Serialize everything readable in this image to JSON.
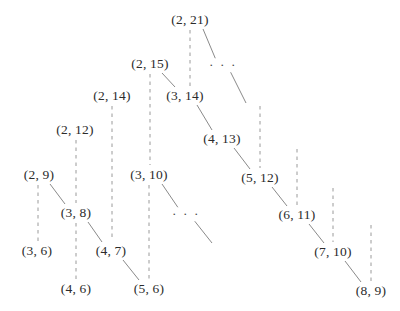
{
  "diagram": {
    "type": "tree",
    "title": "",
    "canvas": {
      "width": 400,
      "height": 311,
      "background": "#ffffff"
    },
    "styles": {
      "solid_edge_color": "#8a8a8a",
      "dashed_edge_color": "#9a9a9a",
      "label_color": "#2b2b2b"
    },
    "nodes": [
      {
        "id": "n2_21",
        "label": "(2, 21)",
        "x": 190,
        "y": 20
      },
      {
        "id": "n2_15",
        "label": "(2, 15)",
        "x": 150,
        "y": 64
      },
      {
        "id": "n3_14",
        "label": "(3, 14)",
        "x": 185,
        "y": 96
      },
      {
        "id": "n2_14",
        "label": "(2, 14)",
        "x": 112,
        "y": 96
      },
      {
        "id": "n4_13",
        "label": "(4, 13)",
        "x": 222,
        "y": 139
      },
      {
        "id": "n2_12",
        "label": "(2, 12)",
        "x": 75,
        "y": 130
      },
      {
        "id": "n3_10",
        "label": "(3, 10)",
        "x": 149,
        "y": 175
      },
      {
        "id": "n5_12",
        "label": "(5, 12)",
        "x": 260,
        "y": 178
      },
      {
        "id": "n2_9",
        "label": "(2, 9)",
        "x": 39,
        "y": 175
      },
      {
        "id": "n3_8",
        "label": "(3, 8)",
        "x": 76,
        "y": 213
      },
      {
        "id": "n6_11",
        "label": "(6, 11)",
        "x": 297,
        "y": 215
      },
      {
        "id": "n3_6",
        "label": "(3, 6)",
        "x": 37,
        "y": 251
      },
      {
        "id": "n4_7",
        "label": "(4, 7)",
        "x": 111,
        "y": 251
      },
      {
        "id": "n7_10",
        "label": "(7, 10)",
        "x": 333,
        "y": 252
      },
      {
        "id": "n4_6",
        "label": "(4, 6)",
        "x": 76,
        "y": 289
      },
      {
        "id": "n5_6",
        "label": "(5, 6)",
        "x": 149,
        "y": 289
      },
      {
        "id": "n8_9",
        "label": "(8, 9)",
        "x": 371,
        "y": 291
      }
    ],
    "ellipses": [
      {
        "id": "e_top",
        "label": "· · ·",
        "x": 223,
        "y": 65
      },
      {
        "id": "e_mid",
        "label": "· · ·",
        "x": 186,
        "y": 214
      }
    ],
    "dashed_edges": [
      {
        "from": "n2_21",
        "to": "n3_14",
        "x1": 190,
        "y1": 30,
        "x2": 190,
        "y2": 86
      },
      {
        "from": "n2_15",
        "to": "n3_10",
        "x1": 150,
        "y1": 74,
        "x2": 150,
        "y2": 165
      },
      {
        "from": "n2_14",
        "to": "n4_7",
        "x1": 112,
        "y1": 106,
        "x2": 112,
        "y2": 241
      },
      {
        "from": "n3_14",
        "to": "n5_12",
        "x1": 260,
        "y1": 106,
        "x2": 260,
        "y2": 168
      },
      {
        "from": "n2_12",
        "to": "n3_8",
        "x1": 76,
        "y1": 140,
        "x2": 76,
        "y2": 203
      },
      {
        "from": "n4_13",
        "to": "n6_11",
        "x1": 297,
        "y1": 149,
        "x2": 297,
        "y2": 205
      },
      {
        "from": "n2_9",
        "to": "n3_6",
        "x1": 38,
        "y1": 185,
        "x2": 38,
        "y2": 241
      },
      {
        "from": "n3_10",
        "to": "n5_6",
        "x1": 149,
        "y1": 185,
        "x2": 149,
        "y2": 279
      },
      {
        "from": "n5_12",
        "to": "n7_10",
        "x1": 333,
        "y1": 188,
        "x2": 333,
        "y2": 242
      },
      {
        "from": "n3_8",
        "to": "n4_6",
        "x1": 76,
        "y1": 223,
        "x2": 76,
        "y2": 279
      },
      {
        "from": "n6_11",
        "to": "n8_9",
        "x1": 371,
        "y1": 225,
        "x2": 371,
        "y2": 281
      }
    ],
    "solid_edges": [
      {
        "from": "n2_21",
        "to": "e_top",
        "x1": 203,
        "y1": 29,
        "x2": 216,
        "y2": 60
      },
      {
        "from": "e_top",
        "to": "n4_13",
        "x1": 230,
        "y1": 71,
        "x2": 246,
        "y2": 103
      },
      {
        "from": "n2_15",
        "to": "n3_14",
        "x1": 162,
        "y1": 73,
        "x2": 175,
        "y2": 87
      },
      {
        "from": "n3_14",
        "to": "n4_13",
        "x1": 197,
        "y1": 105,
        "x2": 212,
        "y2": 130
      },
      {
        "from": "n4_13",
        "to": "n5_12",
        "x1": 234,
        "y1": 148,
        "x2": 250,
        "y2": 169
      },
      {
        "from": "n5_12",
        "to": "n6_11",
        "x1": 272,
        "y1": 187,
        "x2": 287,
        "y2": 206
      },
      {
        "from": "n3_10",
        "to": "e_mid",
        "x1": 162,
        "y1": 184,
        "x2": 179,
        "y2": 209
      },
      {
        "from": "e_mid",
        "to": "n_next",
        "x1": 193,
        "y1": 219,
        "x2": 212,
        "y2": 243
      },
      {
        "from": "n2_9",
        "to": "n3_8",
        "x1": 50,
        "y1": 184,
        "x2": 65,
        "y2": 204
      },
      {
        "from": "n6_11",
        "to": "n7_10",
        "x1": 309,
        "y1": 224,
        "x2": 324,
        "y2": 243
      },
      {
        "from": "n3_8",
        "to": "n4_7",
        "x1": 88,
        "y1": 222,
        "x2": 102,
        "y2": 242
      },
      {
        "from": "n4_7",
        "to": "n5_6",
        "x1": 123,
        "y1": 260,
        "x2": 139,
        "y2": 280
      },
      {
        "from": "n7_10",
        "to": "n8_9",
        "x1": 345,
        "y1": 261,
        "x2": 361,
        "y2": 282
      }
    ]
  }
}
